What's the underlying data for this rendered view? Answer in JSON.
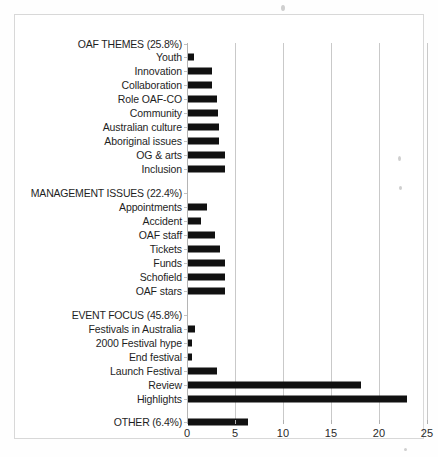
{
  "chart_data": {
    "type": "bar",
    "orientation": "horizontal",
    "title": "",
    "xlabel": "",
    "ylabel": "",
    "xlim": [
      0,
      25
    ],
    "xticks": [
      0,
      5,
      10,
      15,
      20,
      25
    ],
    "xtick_labels": [
      "0",
      "5",
      "10",
      "15",
      "20",
      "25"
    ],
    "grid": true,
    "legend": "none",
    "bar_color": "#111111",
    "groups": [
      {
        "heading": "OAF THEMES (25.8%)",
        "percent": 25.8,
        "categories": [
          "Youth",
          "Innovation",
          "Collaboration",
          "Role OAF-CO",
          "Community",
          "Australian culture",
          "Aboriginal issues",
          "OG & arts",
          "Inclusion"
        ],
        "values": [
          0.6,
          2.5,
          2.5,
          3.0,
          3.1,
          3.2,
          3.2,
          3.9,
          3.9
        ]
      },
      {
        "heading": "MANAGEMENT ISSUES (22.4%)",
        "percent": 22.4,
        "categories": [
          "Appointments",
          "Accident",
          "OAF staff",
          "Tickets",
          "Funds",
          "Schofield",
          "OAF stars"
        ],
        "values": [
          2.0,
          1.4,
          2.8,
          3.3,
          3.9,
          3.9,
          3.9
        ]
      },
      {
        "heading": "EVENT FOCUS (45.8%)",
        "percent": 45.8,
        "categories": [
          "Festivals in Australia",
          "2000 Festival hype",
          "End festival",
          "Launch Festival",
          "Review",
          "Highlights"
        ],
        "values": [
          0.7,
          0.4,
          0.4,
          3.0,
          18.0,
          22.8
        ]
      },
      {
        "heading": "",
        "percent": 6.4,
        "categories": [
          "OTHER (6.4%)"
        ],
        "values": [
          6.3
        ]
      }
    ],
    "categories": [
      "OAF THEMES (25.8%)",
      "Youth",
      "Innovation",
      "Collaboration",
      "Role OAF-CO",
      "Community",
      "Australian culture",
      "Aboriginal issues",
      "OG & arts",
      "Inclusion",
      "MANAGEMENT ISSUES (22.4%)",
      "Appointments",
      "Accident",
      "OAF staff",
      "Tickets",
      "Funds",
      "Schofield",
      "OAF stars",
      "EVENT FOCUS (45.8%)",
      "Festivals in Australia",
      "2000 Festival hype",
      "End festival",
      "Launch Festival",
      "Review",
      "Highlights",
      "OTHER (6.4%)"
    ],
    "values": [
      null,
      0.6,
      2.5,
      2.5,
      3.0,
      3.1,
      3.2,
      3.2,
      3.9,
      3.9,
      null,
      2.0,
      1.4,
      2.8,
      3.3,
      3.9,
      3.9,
      3.9,
      null,
      0.7,
      0.4,
      0.4,
      3.0,
      18.0,
      22.8,
      6.3
    ]
  },
  "rows": [
    {
      "label": "OAF THEMES (25.8%)",
      "value": null,
      "heading": true,
      "y": 28
    },
    {
      "label": "Youth",
      "value": 0.6,
      "heading": false,
      "y": 41
    },
    {
      "label": "Innovation",
      "value": 2.5,
      "heading": false,
      "y": 55
    },
    {
      "label": "Collaboration",
      "value": 2.5,
      "heading": false,
      "y": 69
    },
    {
      "label": "Role OAF-CO",
      "value": 3.0,
      "heading": false,
      "y": 83
    },
    {
      "label": "Community",
      "value": 3.1,
      "heading": false,
      "y": 97
    },
    {
      "label": "Australian culture",
      "value": 3.2,
      "heading": false,
      "y": 111
    },
    {
      "label": "Aboriginal issues",
      "value": 3.2,
      "heading": false,
      "y": 125
    },
    {
      "label": "OG & arts",
      "value": 3.9,
      "heading": false,
      "y": 139
    },
    {
      "label": "Inclusion",
      "value": 3.9,
      "heading": false,
      "y": 153
    },
    {
      "label": "MANAGEMENT ISSUES (22.4%)",
      "value": null,
      "heading": true,
      "y": 177
    },
    {
      "label": "Appointments",
      "value": 2.0,
      "heading": false,
      "y": 191
    },
    {
      "label": "Accident",
      "value": 1.4,
      "heading": false,
      "y": 205
    },
    {
      "label": "OAF staff",
      "value": 2.8,
      "heading": false,
      "y": 219
    },
    {
      "label": "Tickets",
      "value": 3.3,
      "heading": false,
      "y": 233
    },
    {
      "label": "Funds",
      "value": 3.9,
      "heading": false,
      "y": 247
    },
    {
      "label": "Schofield",
      "value": 3.9,
      "heading": false,
      "y": 261
    },
    {
      "label": "OAF stars",
      "value": 3.9,
      "heading": false,
      "y": 275
    },
    {
      "label": "EVENT FOCUS (45.8%)",
      "value": null,
      "heading": true,
      "y": 299
    },
    {
      "label": "Festivals in Australia",
      "value": 0.7,
      "heading": false,
      "y": 313
    },
    {
      "label": "2000 Festival hype",
      "value": 0.4,
      "heading": false,
      "y": 327
    },
    {
      "label": "End festival",
      "value": 0.4,
      "heading": false,
      "y": 341
    },
    {
      "label": "Launch Festival",
      "value": 3.0,
      "heading": false,
      "y": 355
    },
    {
      "label": "Review",
      "value": 18.0,
      "heading": false,
      "y": 369
    },
    {
      "label": "Highlights",
      "value": 22.8,
      "heading": false,
      "y": 383
    },
    {
      "label": "OTHER (6.4%)",
      "value": 6.3,
      "heading": true,
      "y": 406
    }
  ],
  "axis": {
    "ticks": [
      {
        "label": "0",
        "value": 0
      },
      {
        "label": "5",
        "value": 5
      },
      {
        "label": "10",
        "value": 10
      },
      {
        "label": "15",
        "value": 15
      },
      {
        "label": "20",
        "value": 20
      },
      {
        "label": "25",
        "value": 25
      }
    ]
  }
}
